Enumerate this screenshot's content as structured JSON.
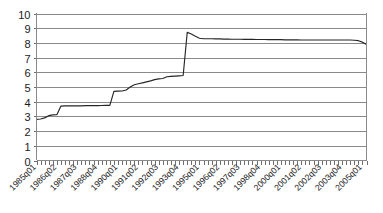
{
  "chart_data": {
    "type": "line",
    "title": "",
    "subtitle": "",
    "xlabel": "",
    "ylabel": "",
    "ylim": [
      0,
      10
    ],
    "ytick_labels": [
      "10",
      "9",
      "8",
      "7",
      "6",
      "5",
      "4",
      "3",
      "2",
      "1",
      "0"
    ],
    "ytick_values": [
      10,
      9,
      8,
      7,
      6,
      5,
      4,
      3,
      2,
      1,
      0
    ],
    "grid": true,
    "legend": false,
    "legend_position": "none",
    "x_tick_label_rotation": -45,
    "x_tick_label_interval": 5,
    "xtick_labels": [
      "1985q01",
      "1986q02",
      "1987q03",
      "1988q04",
      "1990q01",
      "1991q02",
      "1992q03",
      "1993q04",
      "1995q01",
      "1996q02",
      "1997q03",
      "1998q04",
      "2000q01",
      "2001q02",
      "2002q03",
      "2003q04",
      "2005q01"
    ],
    "series": [
      {
        "name": "series-1",
        "color": "#262626",
        "x": [
          "1985q01",
          "1985q02",
          "1985q03",
          "1985q04",
          "1986q01",
          "1986q02",
          "1986q03",
          "1986q04",
          "1987q01",
          "1987q02",
          "1987q03",
          "1987q04",
          "1988q01",
          "1988q02",
          "1988q03",
          "1988q04",
          "1989q01",
          "1989q02",
          "1989q03",
          "1989q04",
          "1990q01",
          "1990q02",
          "1990q03",
          "1990q04",
          "1991q01",
          "1991q02",
          "1991q03",
          "1991q04",
          "1992q01",
          "1992q02",
          "1992q03",
          "1992q04",
          "1993q01",
          "1993q02",
          "1993q03",
          "1993q04",
          "1994q01",
          "1994q02",
          "1994q03",
          "1994q04",
          "1995q01",
          "1995q02",
          "1995q03",
          "1995q04",
          "1996q01",
          "1996q02",
          "1996q03",
          "1996q04",
          "1997q01",
          "1997q02",
          "1997q03",
          "1997q04",
          "1998q01",
          "1998q02",
          "1998q03",
          "1998q04",
          "1999q01",
          "1999q02",
          "1999q03",
          "1999q04",
          "2000q01",
          "2000q02",
          "2000q03",
          "2000q04",
          "2001q01",
          "2001q02",
          "2001q03",
          "2001q04",
          "2002q01",
          "2002q02",
          "2002q03",
          "2002q04",
          "2003q01",
          "2003q02",
          "2003q03",
          "2003q04",
          "2004q01",
          "2004q02",
          "2004q03",
          "2004q04",
          "2005q01",
          "2005q02"
        ],
        "values": [
          2.8,
          2.82,
          2.9,
          3.05,
          3.1,
          3.12,
          3.7,
          3.72,
          3.72,
          3.72,
          3.72,
          3.72,
          3.73,
          3.73,
          3.73,
          3.73,
          3.74,
          3.75,
          3.75,
          4.7,
          4.72,
          4.73,
          4.8,
          5.0,
          5.15,
          5.22,
          5.28,
          5.35,
          5.42,
          5.5,
          5.55,
          5.58,
          5.7,
          5.72,
          5.74,
          5.76,
          5.78,
          8.72,
          8.6,
          8.45,
          8.32,
          8.28,
          8.28,
          8.28,
          8.27,
          8.27,
          8.26,
          8.26,
          8.25,
          8.25,
          8.25,
          8.24,
          8.24,
          8.24,
          8.23,
          8.23,
          8.23,
          8.22,
          8.22,
          8.22,
          8.22,
          8.21,
          8.21,
          8.21,
          8.21,
          8.2,
          8.2,
          8.2,
          8.2,
          8.2,
          8.2,
          8.2,
          8.2,
          8.2,
          8.2,
          8.2,
          8.2,
          8.2,
          8.18,
          8.15,
          8.05,
          7.9
        ]
      }
    ]
  },
  "colors": {
    "grid": "#8a8a8a",
    "axis": "#8a8a8a",
    "line": "#262626",
    "background": "#ffffff",
    "text": "#1a1a1a"
  }
}
